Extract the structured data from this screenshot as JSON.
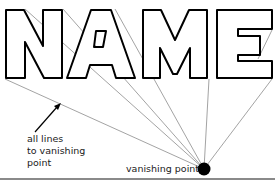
{
  "diagram": {
    "word": "NAME",
    "letters": [
      "N",
      "A",
      "M",
      "E"
    ],
    "labels": {
      "lines_note_line1": "all lines",
      "lines_note_line2": "to vanishing",
      "lines_note_line3": "point",
      "vanishing_point": "vanishing point"
    },
    "vanishing_point": {
      "x": 204,
      "y": 169
    },
    "colors": {
      "outline": "#000000",
      "perspective_lines": "#8c8c8c",
      "dot": "#000000",
      "rule": "#8a8a8a",
      "background": "#ffffff"
    }
  }
}
